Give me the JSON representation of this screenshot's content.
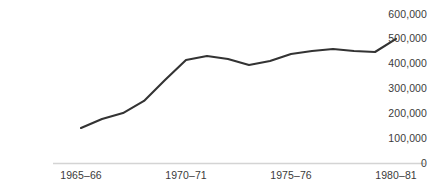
{
  "chart_data": {
    "type": "line",
    "title": "",
    "subtitle": "",
    "xlabel": "",
    "ylabel": "",
    "grid": false,
    "legend": null,
    "legend_position": "none",
    "line_color": "#333333",
    "axis_color": "#d4d4d4",
    "text_color": "#3b3b3b",
    "ylim": [
      0,
      600000
    ],
    "yticks": [
      0,
      100000,
      200000,
      300000,
      400000,
      500000,
      600000
    ],
    "ytick_labels": [
      "0",
      "100,000",
      "200,000",
      "300,000",
      "400,000",
      "500,000",
      "600,000"
    ],
    "xticks": [
      "1965–66",
      "1970–71",
      "1975–76",
      "1980–81"
    ],
    "x": [
      "1965–66",
      "1966–67",
      "1967–68",
      "1968–69",
      "1969–70",
      "1970–71",
      "1971–72",
      "1972–73",
      "1973–74",
      "1974–75",
      "1975–76",
      "1976–77",
      "1977–78",
      "1978–79",
      "1979–80",
      "1980–81"
    ],
    "values": [
      141000,
      177000,
      201000,
      250000,
      334000,
      415000,
      431000,
      419000,
      395000,
      411000,
      439000,
      451000,
      459000,
      451000,
      447000,
      500000
    ]
  }
}
